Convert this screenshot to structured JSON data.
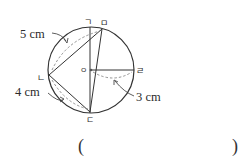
{
  "diagram": {
    "type": "geometry-circle",
    "center_label": "ㅇ",
    "points": {
      "top": "ㄱ",
      "top_right": "ㅁ",
      "left": "ㄴ",
      "bottom": "ㄷ",
      "right": "ㄹ"
    },
    "measurements": {
      "chord_nm": "5 cm",
      "chord_nd": "4 cm",
      "radius": "3 cm"
    },
    "colors": {
      "stroke": "#333333",
      "dash": "#666666",
      "text": "#2b2b2b"
    }
  },
  "answer": {
    "open_paren": "(",
    "close_paren": ")"
  }
}
